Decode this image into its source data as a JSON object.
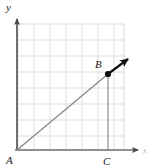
{
  "figure": {
    "type": "geometry-diagram",
    "background_color": "#ffffff",
    "axes": {
      "x_label": "x",
      "y_label": "y",
      "axis_color": "#6f6f6f",
      "origin_label": "A",
      "x_axis_y": 150,
      "y_axis_x": 17,
      "x_arrow_tip_x": 141,
      "y_arrow_tip_y": 16
    },
    "grid": {
      "visible": true,
      "color": "#d9d9d9",
      "spacing": 16,
      "left": 18,
      "right": 124,
      "top": 24,
      "bottom": 150,
      "columns": 7,
      "rows": 8
    },
    "points": [
      {
        "name": "A",
        "label": "A",
        "x": 17,
        "y": 150,
        "label_x": 8,
        "label_y": 163,
        "marker": "none"
      },
      {
        "name": "B",
        "label": "B",
        "x": 108,
        "y": 74,
        "label_x": 96,
        "label_y": 67,
        "marker": "dot"
      },
      {
        "name": "C",
        "label": "C",
        "x": 108,
        "y": 150,
        "label_x": 104,
        "label_y": 164,
        "marker": "none"
      }
    ],
    "segments": [
      {
        "name": "ray-a-to-b",
        "from": "A",
        "to": "B",
        "color": "#8d8d8d",
        "width": 1.4
      },
      {
        "name": "segment-b-to-c",
        "from": "B",
        "to": "C",
        "color": "#8d8d8d",
        "width": 1.2
      }
    ],
    "arrow": {
      "name": "vector-arrow-from-b",
      "color": "#121212",
      "width": 2.2,
      "start_x": 108,
      "start_y": 74,
      "end_x": 131,
      "end_y": 57,
      "head_size": 7
    },
    "colors": {
      "ray": "#8d8d8d",
      "arrow": "#121212",
      "grid": "#d9d9d9",
      "axis": "#6f6f6f",
      "label": "#1a1a1a"
    }
  }
}
